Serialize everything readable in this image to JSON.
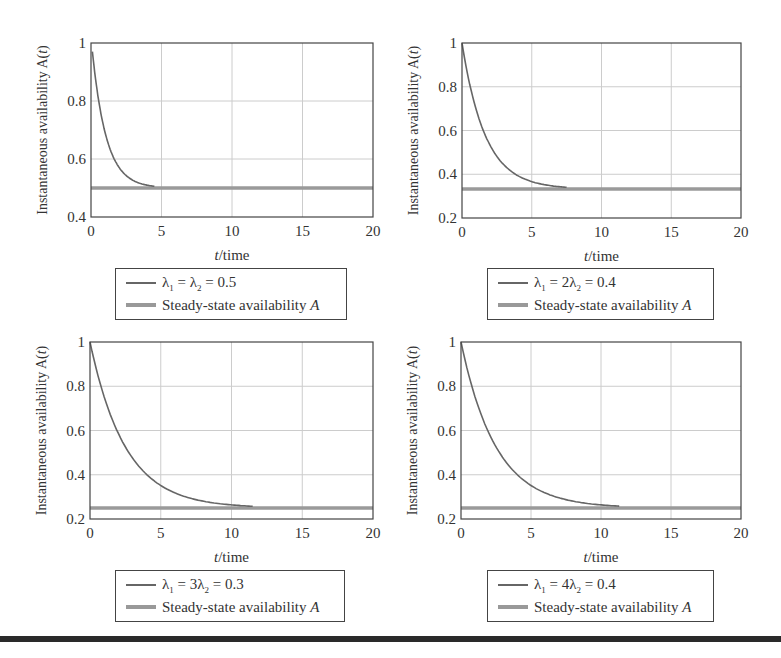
{
  "chart_data": [
    {
      "type": "line",
      "panel": "top-left",
      "xlabel": "t/time",
      "ylabel": "Instantaneous availability A(t)",
      "xlim": [
        0,
        20
      ],
      "ylim": [
        0.4,
        1
      ],
      "xticks": [
        0,
        5,
        10,
        15,
        20
      ],
      "yticks": [
        0.4,
        0.6,
        0.8,
        1
      ],
      "ytick_labels": [
        "0.4",
        "0.6",
        "0.8",
        "1"
      ],
      "grid": true,
      "legend": [
        "λ1 = λ2 = 0.5",
        "Steady-state availability A"
      ],
      "legend_parts": {
        "curve": [
          "λ",
          "1",
          " = λ",
          "2",
          " = 0.5"
        ],
        "steady": "Steady-state availability A"
      },
      "series": [
        {
          "name": "λ1 = λ2 = 0.5",
          "x": [
            0.1,
            0.5,
            1,
            1.5,
            2,
            2.5,
            3,
            3.5,
            4,
            4.5
          ],
          "y": [
            0.97,
            0.8,
            0.68,
            0.61,
            0.568,
            0.541,
            0.525,
            0.515,
            0.509,
            0.506
          ]
        },
        {
          "name": "Steady-state availability A",
          "x": [
            0,
            20
          ],
          "y": [
            0.5,
            0.5
          ]
        }
      ],
      "model": {
        "steady": 0.5,
        "rate": 1.0,
        "t_start": 0.1,
        "t_end": 4.5
      }
    },
    {
      "type": "line",
      "panel": "top-right",
      "xlabel": "t/time",
      "ylabel": "Instantaneous availability A(t)",
      "xlim": [
        0,
        20
      ],
      "ylim": [
        0.2,
        1
      ],
      "xticks": [
        0,
        5,
        10,
        15,
        20
      ],
      "yticks": [
        0.2,
        0.4,
        0.6,
        0.8,
        1
      ],
      "ytick_labels": [
        "0.2",
        "0.4",
        "0.6",
        "0.8",
        "1"
      ],
      "grid": true,
      "legend": [
        "λ1 = 2λ2 = 0.4",
        "Steady-state availability A"
      ],
      "legend_parts": {
        "curve": [
          "λ",
          "1",
          " = 2λ",
          "2",
          " = 0.4"
        ],
        "steady": "Steady-state availability A"
      },
      "series": [
        {
          "name": "λ1 = 2λ2 = 0.4",
          "x": [
            0,
            1,
            2,
            3,
            4,
            5,
            6,
            7,
            7.5
          ],
          "y": [
            1.0,
            0.7,
            0.53,
            0.44,
            0.39,
            0.365,
            0.35,
            0.34,
            0.338
          ]
        },
        {
          "name": "Steady-state availability A",
          "x": [
            0,
            20
          ],
          "y": [
            0.333,
            0.333
          ]
        }
      ],
      "model": {
        "steady": 0.333,
        "rate": 0.6,
        "t_start": 0,
        "t_end": 7.5
      }
    },
    {
      "type": "line",
      "panel": "bottom-left",
      "xlabel": "t/time",
      "ylabel": "Instantaneous availability A(t)",
      "xlim": [
        0,
        20
      ],
      "ylim": [
        0.2,
        1
      ],
      "xticks": [
        0,
        5,
        10,
        15,
        20
      ],
      "yticks": [
        0.2,
        0.4,
        0.6,
        0.8,
        1
      ],
      "ytick_labels": [
        "0.2",
        "0.4",
        "0.6",
        "0.8",
        "1"
      ],
      "grid": true,
      "legend": [
        "λ1 = 3λ2 = 0.3",
        "Steady-state availability A"
      ],
      "legend_parts": {
        "curve": [
          "λ",
          "1",
          " = 3λ",
          "2",
          " = 0.3"
        ],
        "steady": "Steady-state availability A"
      },
      "series": [
        {
          "name": "λ1 = 3λ2 = 0.3",
          "x": [
            0,
            1,
            2,
            3,
            4,
            5,
            6,
            7,
            8,
            9,
            10,
            11.5
          ],
          "y": [
            1.0,
            0.75,
            0.59,
            0.48,
            0.4,
            0.35,
            0.32,
            0.295,
            0.28,
            0.27,
            0.264,
            0.258
          ]
        },
        {
          "name": "Steady-state availability A",
          "x": [
            0,
            20
          ],
          "y": [
            0.25,
            0.25
          ]
        }
      ],
      "model": {
        "steady": 0.25,
        "rate": 0.4,
        "t_start": 0,
        "t_end": 11.5
      }
    },
    {
      "type": "line",
      "panel": "bottom-right",
      "xlabel": "t/time",
      "ylabel": "Instantaneous availability A(t)",
      "xlim": [
        0,
        20
      ],
      "ylim": [
        0.2,
        1
      ],
      "xticks": [
        0,
        5,
        10,
        15,
        20
      ],
      "yticks": [
        0.2,
        0.4,
        0.6,
        0.8,
        1
      ],
      "ytick_labels": [
        "0.2",
        "0.4",
        "0.6",
        "0.8",
        "1"
      ],
      "grid": true,
      "legend": [
        "λ1 = 4λ2 = 0.4",
        "Steady-state availability A"
      ],
      "legend_parts": {
        "curve": [
          "λ",
          "1",
          " = 4λ",
          "2",
          " = 0.4"
        ],
        "steady": "Steady-state availability A"
      },
      "series": [
        {
          "name": "λ1 = 4λ2 = 0.4",
          "x": [
            0,
            1,
            2,
            3,
            4,
            5,
            6,
            7,
            8,
            9,
            10,
            11.3
          ],
          "y": [
            1.0,
            0.75,
            0.59,
            0.48,
            0.4,
            0.35,
            0.32,
            0.295,
            0.28,
            0.27,
            0.264,
            0.258
          ]
        },
        {
          "name": "Steady-state availability A",
          "x": [
            0,
            20
          ],
          "y": [
            0.25,
            0.25
          ]
        }
      ],
      "model": {
        "steady": 0.25,
        "rate": 0.4,
        "t_start": 0,
        "t_end": 11.3
      }
    }
  ],
  "layout": {
    "panels": [
      {
        "x0": 91,
        "x1": 373,
        "y0": 43,
        "y1": 217,
        "legend": {
          "left": 115,
          "top": 268,
          "width": 232,
          "height": 52
        }
      },
      {
        "x0": 462,
        "x1": 741,
        "y0": 43,
        "y1": 218,
        "legend": {
          "left": 487,
          "top": 268,
          "width": 227,
          "height": 52
        }
      },
      {
        "x0": 90,
        "x1": 373,
        "y0": 342,
        "y1": 519,
        "legend": {
          "left": 115,
          "top": 570,
          "width": 230,
          "height": 52
        }
      },
      {
        "x0": 461,
        "x1": 741,
        "y0": 342,
        "y1": 519,
        "legend": {
          "left": 487,
          "top": 570,
          "width": 227,
          "height": 52
        }
      }
    ]
  },
  "colors": {
    "curve": "#666666",
    "steady": "#9a9a9a",
    "grid": "#cccccc",
    "frame": "#444444",
    "text": "#333333"
  }
}
